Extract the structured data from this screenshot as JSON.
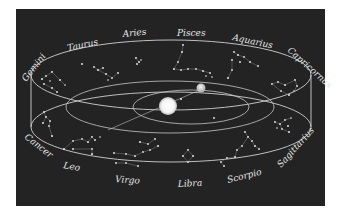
{
  "diagram": {
    "title": "",
    "colors": {
      "background": "#232323",
      "frame": "#ffffff",
      "lines": "#d0d0d0",
      "text": "#e6e6e6",
      "sun": "#ffffff",
      "earth": "#dcdcdc"
    },
    "center_objects": [
      {
        "id": "sun",
        "label": ""
      },
      {
        "id": "earth",
        "label": ""
      }
    ],
    "constellations": [
      {
        "id": "aries",
        "label": "Aries"
      },
      {
        "id": "pisces",
        "label": "Pisces"
      },
      {
        "id": "aquarius",
        "label": "Aquarius"
      },
      {
        "id": "capricornus",
        "label": "Capricornus"
      },
      {
        "id": "sagittarius",
        "label": "Sagittarius"
      },
      {
        "id": "scorpio",
        "label": "Scorpio"
      },
      {
        "id": "libra",
        "label": "Libra"
      },
      {
        "id": "virgo",
        "label": "Virgo"
      },
      {
        "id": "leo",
        "label": "Leo"
      },
      {
        "id": "cancer",
        "label": "Cancer"
      },
      {
        "id": "gemini",
        "label": "Gemini"
      },
      {
        "id": "taurus",
        "label": "Taurus"
      }
    ]
  }
}
